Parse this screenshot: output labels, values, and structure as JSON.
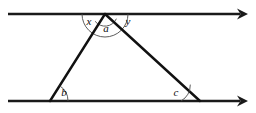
{
  "diagram": {
    "type": "geometry-figure",
    "colors": {
      "background": "#ffffff",
      "line": "#1a1a1a",
      "triangle": "#111111",
      "arc": "#4a4a4a",
      "label": "#0d0d0d"
    },
    "parallel_lines": [
      {
        "name": "top-parallel-line",
        "x1": 8,
        "y1": 14,
        "x2": 240,
        "y2": 14,
        "arrow": "right"
      },
      {
        "name": "bottom-parallel-line",
        "x1": 8,
        "y1": 101,
        "x2": 240,
        "y2": 101,
        "arrow": "right"
      }
    ],
    "triangle": {
      "apex": {
        "x": 105,
        "y": 14
      },
      "left_vertex": {
        "x": 50,
        "y": 101
      },
      "right_vertex": {
        "x": 200,
        "y": 101
      }
    },
    "arcs": [
      {
        "name": "apex-outer-arc",
        "cx": 105,
        "cy": 14,
        "r": 23
      },
      {
        "name": "apex-inner-arc",
        "cx": 105,
        "cy": 14,
        "r": 12.5
      },
      {
        "name": "left-vertex-arc",
        "cx": 50,
        "cy": 101,
        "r": 18
      },
      {
        "name": "right-vertex-arc",
        "cx": 200,
        "cy": 101,
        "r": 19
      }
    ],
    "labels": [
      {
        "name": "angle-label-x",
        "text": "x",
        "x": 89,
        "y": 22
      },
      {
        "name": "angle-label-a",
        "text": "a",
        "x": 106,
        "y": 29
      },
      {
        "name": "angle-label-y",
        "text": "y",
        "x": 128,
        "y": 22
      },
      {
        "name": "angle-label-b",
        "text": "b",
        "x": 64,
        "y": 93
      },
      {
        "name": "angle-label-c",
        "text": "c",
        "x": 176,
        "y": 93
      }
    ]
  }
}
